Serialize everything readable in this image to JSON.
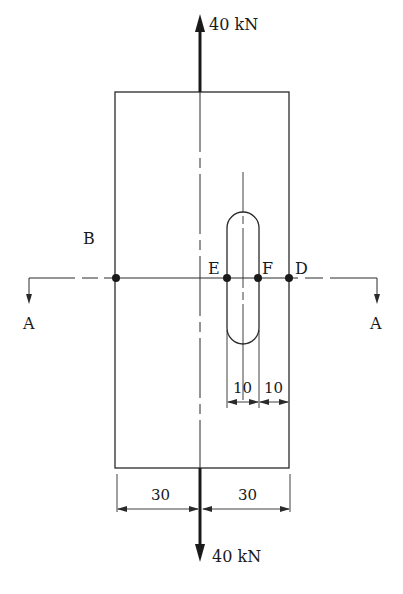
{
  "diagram": {
    "type": "plate-with-slot-axial-load",
    "loads": {
      "top": {
        "label": "40 kN",
        "direction": "up"
      },
      "bottom": {
        "label": "40 kN",
        "direction": "down"
      }
    },
    "points": {
      "B": "B",
      "E": "E",
      "F": "F",
      "D": "D"
    },
    "section": {
      "left_label": "A",
      "right_label": "A"
    },
    "dimensions": {
      "slot_left": "10",
      "slot_right": "10",
      "half_width_left": "30",
      "half_width_right": "30"
    },
    "colors": {
      "line": "#2a2a2a",
      "background": "#ffffff"
    }
  }
}
